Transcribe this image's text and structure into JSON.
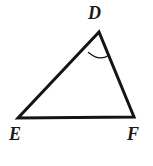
{
  "figure": {
    "name": "triangle-DEF",
    "background_color": "#ffffff",
    "stroke_color": "#141414",
    "label_color": "#1a1a1a",
    "stroke_width": 3,
    "arc_stroke_width": 1.2,
    "vertices": [
      {
        "id": "D",
        "label": "D",
        "x": 99,
        "y": 32,
        "role": "apex"
      },
      {
        "id": "E",
        "label": "E",
        "x": 18,
        "y": 118,
        "role": "bottom-left"
      },
      {
        "id": "F",
        "label": "F",
        "x": 134,
        "y": 117,
        "role": "bottom-right"
      }
    ],
    "edges": [
      {
        "id": "DE",
        "from": "D",
        "to": "E"
      },
      {
        "id": "EF",
        "from": "E",
        "to": "F"
      },
      {
        "id": "FD",
        "from": "F",
        "to": "D"
      }
    ],
    "angle_marks": [
      {
        "id": "angle-D",
        "at_vertex": "D",
        "style": "single-arc",
        "path": "M 88.5 52.5 Q 99 61.5 108.5 55.5"
      }
    ],
    "labels": {
      "D": "D",
      "E": "E",
      "F": "F"
    }
  }
}
